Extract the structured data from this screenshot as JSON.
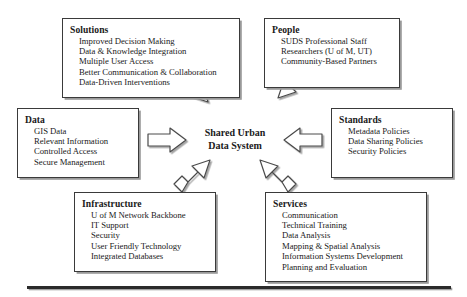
{
  "diagram": {
    "center": {
      "line1": "Shared Urban",
      "line2": "Data System"
    },
    "nodes": [
      {
        "id": "solutions",
        "title": "Solutions",
        "items": [
          "Improved Decision Making",
          "Data & Knowledge Integration",
          "Multiple User Access",
          "Better Communication & Collaboration",
          "Data-Driven Interventions"
        ]
      },
      {
        "id": "people",
        "title": "People",
        "items": [
          "SUDS Professional Staff",
          "Researchers (U of M, UT)",
          "Community-Based Partners"
        ]
      },
      {
        "id": "data",
        "title": "Data",
        "items": [
          "GIS Data",
          "Relevant Information",
          "Controlled Access",
          "Secure Management"
        ]
      },
      {
        "id": "standards",
        "title": "Standards",
        "items": [
          "Metadata Policies",
          "Data Sharing Policies",
          "Security Policies"
        ]
      },
      {
        "id": "infrastructure",
        "title": "Infrastructure",
        "items": [
          "U of M Network Backbone",
          "IT Support",
          "Security",
          "User Friendly Technology",
          "Integrated Databases"
        ]
      },
      {
        "id": "services",
        "title": "Services",
        "items": [
          "Communication",
          "Technical Training",
          "Data Analysis",
          "Mapping & Spatial Analysis",
          "Information Systems Development",
          "Planning and Evaluation"
        ]
      }
    ],
    "arrows": [
      {
        "id": "solutions-to-center",
        "direction": "down-right"
      },
      {
        "id": "people-to-center",
        "direction": "down-left"
      },
      {
        "id": "data-to-center",
        "direction": "right"
      },
      {
        "id": "standards-to-center",
        "direction": "left"
      },
      {
        "id": "infrastructure-to-center",
        "direction": "up-right"
      },
      {
        "id": "services-to-center",
        "direction": "up-left"
      }
    ],
    "colors": {
      "box_border": "#3a3a3a",
      "box_shadow": "#9a9a9a",
      "arrow_outline": "#4a4a4a",
      "arrow_fill": "#ffffff",
      "rule": "#2b2b2b",
      "background": "#ffffff"
    }
  }
}
